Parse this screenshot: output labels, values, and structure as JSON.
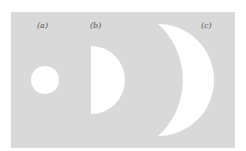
{
  "diagram": {
    "background_color": "#ffffff",
    "panel_color": "#d9d9d9",
    "shape_color": "#ffffff",
    "figures": [
      {
        "id": "a",
        "label": "(a)",
        "shape": "full-disc"
      },
      {
        "id": "b",
        "label": "(b)",
        "shape": "half-disc"
      },
      {
        "id": "c",
        "label": "(c)",
        "shape": "crescent"
      }
    ]
  }
}
